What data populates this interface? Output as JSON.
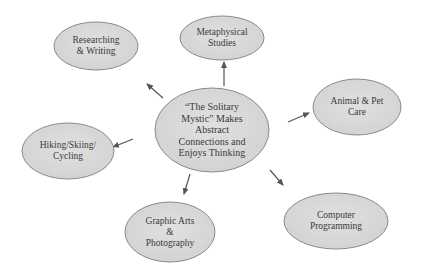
{
  "diagram": {
    "colors": {
      "background": "#ffffff",
      "ellipse_fill": "#d9d9d9",
      "ellipse_stroke": "#8a8a8a",
      "arrow": "#555555",
      "text": "#3a3a3a"
    },
    "center": {
      "label": "“The Solitary\nMystic” Makes\nAbstract\nConnections and\nEnjoys Thinking",
      "cx": 212,
      "cy": 130,
      "rx": 57,
      "ry": 42
    },
    "nodes": [
      {
        "id": "metaphysical",
        "label": "Metaphysical\nStudies",
        "cx": 222,
        "cy": 38,
        "rx": 42,
        "ry": 22
      },
      {
        "id": "researching",
        "label": "Researching\n& Writing",
        "cx": 96,
        "cy": 46,
        "rx": 42,
        "ry": 24
      },
      {
        "id": "animal",
        "label": "Animal & Pet\nCare",
        "cx": 357,
        "cy": 107,
        "rx": 44,
        "ry": 28
      },
      {
        "id": "hiking",
        "label": "Hiking/Skiing/\nCycling",
        "cx": 68,
        "cy": 151,
        "rx": 46,
        "ry": 28
      },
      {
        "id": "graphic",
        "label": "Graphic Arts\n&\nPhotography",
        "cx": 170,
        "cy": 232,
        "rx": 45,
        "ry": 30
      },
      {
        "id": "computer",
        "label": "Computer\nProgramming",
        "cx": 336,
        "cy": 221,
        "rx": 52,
        "ry": 28
      }
    ],
    "arrows": [
      {
        "to": "metaphysical",
        "x1": 224,
        "y1": 86,
        "x2": 224,
        "y2": 62
      },
      {
        "to": "researching",
        "x1": 163,
        "y1": 98,
        "x2": 147,
        "y2": 84
      },
      {
        "to": "animal",
        "x1": 288,
        "y1": 122,
        "x2": 309,
        "y2": 113
      },
      {
        "to": "hiking",
        "x1": 133,
        "y1": 139,
        "x2": 113,
        "y2": 147
      },
      {
        "to": "graphic",
        "x1": 190,
        "y1": 174,
        "x2": 184,
        "y2": 194
      },
      {
        "to": "computer",
        "x1": 270,
        "y1": 170,
        "x2": 283,
        "y2": 185
      }
    ]
  }
}
